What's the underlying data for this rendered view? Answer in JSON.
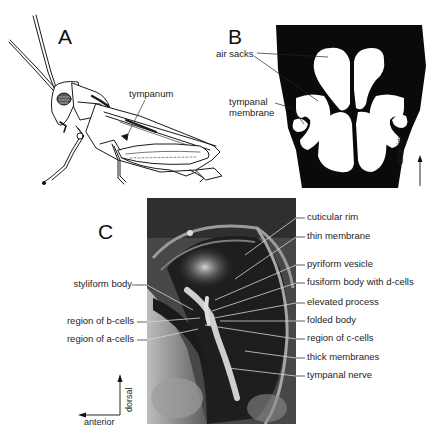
{
  "figure": {
    "panels": [
      {
        "id": "A",
        "letter": "A",
        "type": "line-drawing",
        "subject": "grasshopper-lateral-view",
        "labels": [
          {
            "text": "tympanum"
          }
        ]
      },
      {
        "id": "B",
        "letter": "B",
        "type": "schematic",
        "subject": "tympanal-organ-cross-section",
        "labels": [
          {
            "text": "air sacks"
          },
          {
            "text": "tympanal membrane",
            "lines": [
              "tympanal",
              "membrane"
            ]
          }
        ],
        "orientation": {
          "text": "anterior",
          "arrow": "up"
        }
      },
      {
        "id": "C",
        "letter": "C",
        "type": "photomicrograph",
        "subject": "tympanal-organ-inner-view",
        "labels_left": [
          {
            "text": "styliform body"
          },
          {
            "text": "region of b-cells"
          },
          {
            "text": "region of a-cells"
          }
        ],
        "labels_right": [
          {
            "text": "cuticular rim"
          },
          {
            "text": "thin membrane"
          },
          {
            "text": "pyriform vesicle"
          },
          {
            "text": "fusiform body with d-cells"
          },
          {
            "text": "elevated process"
          },
          {
            "text": "folded body"
          },
          {
            "text": "region of c-cells"
          },
          {
            "text": "thick membranes"
          },
          {
            "text": "tympanal nerve"
          }
        ],
        "orientation": {
          "vertical": "dorsal",
          "horizontal": "anterior"
        }
      }
    ],
    "colors": {
      "background": "#ffffff",
      "ink": "#111111",
      "leader_line_on_photo": "#d8d8d8"
    }
  }
}
